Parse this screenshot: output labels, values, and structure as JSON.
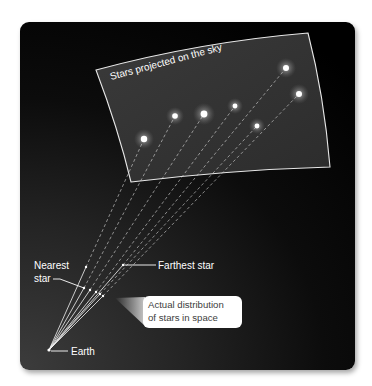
{
  "diagram": {
    "title": "Stars projected on the sky",
    "labels": {
      "sky_plane": "Stars projected on the sky",
      "nearest_line1": "Nearest",
      "nearest_line2": "star",
      "farthest": "Farthest star",
      "earth": "Earth",
      "callout_line1": "Actual distribution",
      "callout_line2": "of stars in space"
    },
    "earth_position": [
      49,
      350
    ],
    "sky_plane_corners": [
      [
        96,
        70
      ],
      [
        308,
        33
      ],
      [
        330,
        167
      ],
      [
        131,
        182
      ]
    ],
    "projected_stars": [
      {
        "x": 144,
        "y": 139,
        "size": 3.2
      },
      {
        "x": 175,
        "y": 116,
        "size": 2.8
      },
      {
        "x": 204,
        "y": 114,
        "size": 3.4
      },
      {
        "x": 235,
        "y": 106,
        "size": 2.4
      },
      {
        "x": 257,
        "y": 126,
        "size": 2.4
      },
      {
        "x": 286,
        "y": 68,
        "size": 3.0
      },
      {
        "x": 299,
        "y": 94,
        "size": 3.0
      }
    ],
    "actual_star_dots": [
      {
        "x": 86,
        "y": 267
      },
      {
        "x": 84,
        "y": 288
      },
      {
        "x": 90,
        "y": 290
      },
      {
        "x": 96,
        "y": 292
      },
      {
        "x": 100,
        "y": 294
      },
      {
        "x": 103,
        "y": 296
      },
      {
        "x": 123,
        "y": 265
      }
    ],
    "colors": {
      "panel_dark": "#000000",
      "panel_light": "#3c3c3c",
      "sky_plane_fill": "#333333",
      "line": "#ffffff",
      "text": "#ffffff",
      "callout_bg": "#ffffff",
      "callout_text": "#404040"
    }
  }
}
